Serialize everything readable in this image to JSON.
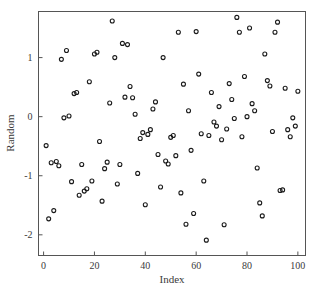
{
  "chart_data": {
    "type": "scatter",
    "title": "",
    "xlabel": "Index",
    "ylabel": "Random",
    "xlim": [
      -2,
      103
    ],
    "ylim": [
      -2.35,
      1.78
    ],
    "xticks": [
      0,
      20,
      40,
      60,
      80,
      100
    ],
    "xtick_labels": [
      "0",
      "20",
      "40",
      "60",
      "80",
      "100"
    ],
    "yticks": [
      1,
      0,
      -1,
      -2
    ],
    "ytick_labels": [
      "1",
      "0",
      "-1",
      "-2"
    ],
    "grid": false,
    "legend": false,
    "marker": "open-circle",
    "marker_color": "#1a1a1a",
    "marker_size": 4,
    "series": [
      {
        "name": "Random",
        "x": [
          1,
          2,
          3,
          4,
          5,
          6,
          7,
          8,
          9,
          10,
          11,
          12,
          13,
          14,
          15,
          16,
          17,
          18,
          19,
          20,
          21,
          22,
          23,
          24,
          25,
          26,
          27,
          28,
          29,
          30,
          31,
          32,
          33,
          34,
          35,
          36,
          37,
          38,
          39,
          40,
          41,
          42,
          43,
          44,
          45,
          46,
          47,
          48,
          49,
          50,
          51,
          52,
          53,
          54,
          55,
          56,
          57,
          58,
          59,
          60,
          61,
          62,
          63,
          64,
          65,
          66,
          67,
          68,
          69,
          70,
          71,
          72,
          73,
          74,
          75,
          76,
          77,
          78,
          79,
          80,
          81,
          82,
          83,
          84,
          85,
          86,
          87,
          88,
          89,
          90,
          91,
          92,
          93,
          94,
          95,
          96,
          97,
          98,
          99,
          100
        ],
        "y": [
          -0.49,
          -1.73,
          -0.78,
          -1.59,
          -0.76,
          -0.83,
          0.97,
          -0.02,
          1.12,
          0.01,
          -1.1,
          0.39,
          0.41,
          -1.33,
          -0.81,
          -1.26,
          -1.22,
          0.59,
          -1.09,
          1.06,
          1.09,
          -0.42,
          -1.43,
          -0.88,
          -0.77,
          0.23,
          1.62,
          1.0,
          -1.14,
          -0.81,
          1.24,
          0.33,
          1.22,
          0.51,
          0.32,
          0.04,
          -0.96,
          -0.37,
          -0.27,
          -1.49,
          -0.3,
          -0.22,
          0.13,
          0.25,
          -0.64,
          -1.19,
          1.0,
          -0.75,
          -0.8,
          -0.35,
          -0.32,
          -0.66,
          1.43,
          -1.29,
          0.55,
          -1.82,
          0.1,
          -0.57,
          -1.64,
          1.44,
          0.72,
          -0.29,
          -1.09,
          -2.09,
          -0.32,
          0.41,
          -0.09,
          -0.16,
          0.17,
          -0.39,
          -1.83,
          -0.21,
          0.56,
          0.29,
          -0.03,
          1.68,
          1.43,
          -0.34,
          0.68,
          0.0,
          1.5,
          0.22,
          0.1,
          -0.87,
          -1.46,
          -1.68,
          1.06,
          0.61,
          0.52,
          -0.25,
          1.43,
          1.6,
          -1.25,
          -1.24,
          0.48,
          -0.22,
          -0.34,
          -0.02,
          -0.16,
          0.43
        ]
      }
    ]
  },
  "figure": {
    "background_color": "#ffffff",
    "axis_color": "#555555",
    "text_color": "#3a3a3a"
  }
}
